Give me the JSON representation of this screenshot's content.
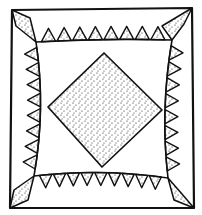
{
  "artwork": {
    "subject": "Quilt block line drawing",
    "description": "Square quilt block with a stippled center diamond, sawtooth triangle borders along each side, and stippled kite shapes in each corner",
    "colors": {
      "ink": "#111111",
      "paper": "#ffffff"
    },
    "motifs": {
      "center": "stippled diamond",
      "borders": "sawtooth triangles",
      "corners": "stippled kites"
    },
    "sawtooth_counts": {
      "top": 8,
      "left": 8,
      "right": 8,
      "bottom": 9
    }
  }
}
